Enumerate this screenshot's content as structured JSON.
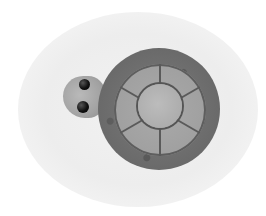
{
  "image": {
    "subject": "crocheted turtle",
    "description": "Grayscale photo of a small crocheted turtle toy viewed from above on a white oval backdrop",
    "colors": {
      "background": "#ffffff",
      "backdrop": "#efefef",
      "shell_rim": "#6a6a6a",
      "shell_plates": "#a0a0a0",
      "shell_center": "#adadad",
      "head": "#a3a3a3",
      "eyes": "#000000"
    },
    "parts": [
      "head",
      "left-eye",
      "right-eye",
      "shell-rim",
      "shell-plates",
      "shell-center"
    ]
  }
}
